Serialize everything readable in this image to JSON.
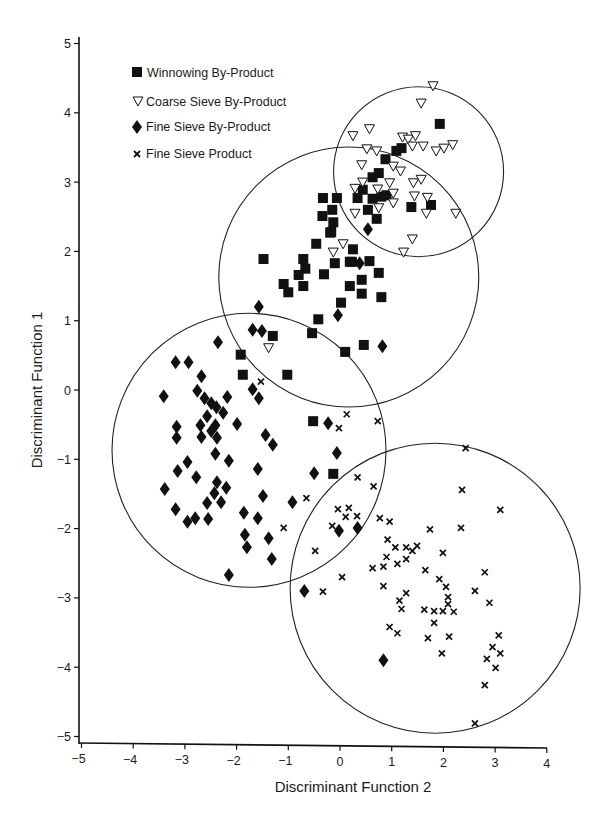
{
  "chart_data": {
    "type": "scatter",
    "title": "",
    "xlabel": "Discriminant Function 2",
    "ylabel": "Discriminant Function 1",
    "xlim": [
      -5,
      4
    ],
    "ylim": [
      -5,
      5
    ],
    "xticks": [
      "-5",
      "-4",
      "-3",
      "-2",
      "-1",
      "0",
      "1",
      "2",
      "3",
      "4"
    ],
    "yticks": [
      "5",
      "4",
      "3",
      "2",
      "1",
      "0",
      "-1",
      "-2",
      "-3",
      "-4",
      "-5"
    ],
    "grid": false,
    "legend_position": "upper-left",
    "legend": [
      {
        "label": "Winnowing By-Product",
        "marker": "filled-square"
      },
      {
        "label": "Coarse Sieve By-Product",
        "marker": "open-triangle-down"
      },
      {
        "label": "Fine Sieve By-Product",
        "marker": "filled-diamond"
      },
      {
        "label": "Fine Sieve Product",
        "marker": "x-cross"
      }
    ],
    "circles": [
      {
        "group": "Coarse Sieve By-Product",
        "cx": 1.52,
        "cy": 3.15,
        "r_px": 85
      },
      {
        "group": "Winnowing By-Product",
        "cx": 0.17,
        "cy": 1.63,
        "r_px": 130
      },
      {
        "group": "Fine Sieve By-Product",
        "cx": -1.76,
        "cy": -0.87,
        "r_px": 137
      },
      {
        "group": "Fine Sieve Product",
        "cx": 1.84,
        "cy": -2.86,
        "r_px": 145
      }
    ],
    "series": [
      {
        "name": "Winnowing By-Product",
        "marker": "filled-square",
        "points": [
          [
            1.93,
            3.84
          ],
          [
            1.19,
            3.49
          ],
          [
            1.09,
            3.45
          ],
          [
            0.88,
            3.33
          ],
          [
            0.75,
            3.13
          ],
          [
            0.63,
            3.07
          ],
          [
            0.44,
            2.89
          ],
          [
            0.34,
            2.77
          ],
          [
            0.63,
            2.76
          ],
          [
            0.8,
            2.79
          ],
          [
            0.9,
            2.81
          ],
          [
            0.54,
            2.6
          ],
          [
            0.71,
            2.47
          ],
          [
            1.38,
            2.64
          ],
          [
            1.76,
            2.67
          ],
          [
            -0.33,
            2.77
          ],
          [
            -0.06,
            2.77
          ],
          [
            -0.15,
            2.6
          ],
          [
            -0.13,
            2.42
          ],
          [
            -0.19,
            2.27
          ],
          [
            0.25,
            2.03
          ],
          [
            -0.1,
            1.83
          ],
          [
            0.19,
            1.85
          ],
          [
            0.57,
            1.86
          ],
          [
            -0.34,
            2.51
          ],
          [
            -0.17,
            2.28
          ],
          [
            -0.46,
            2.11
          ],
          [
            -1.48,
            1.89
          ],
          [
            -0.71,
            1.89
          ],
          [
            -0.67,
            1.75
          ],
          [
            -0.8,
            1.66
          ],
          [
            -0.31,
            1.67
          ],
          [
            0.23,
            1.85
          ],
          [
            0.75,
            1.69
          ],
          [
            0.42,
            1.59
          ],
          [
            0.19,
            1.5
          ],
          [
            0.42,
            1.39
          ],
          [
            0.8,
            1.34
          ],
          [
            -1.09,
            1.53
          ],
          [
            -1.0,
            1.41
          ],
          [
            -0.71,
            1.5
          ],
          [
            0.02,
            1.26
          ],
          [
            -0.42,
            1.02
          ],
          [
            -0.54,
            0.82
          ],
          [
            -1.3,
            0.78
          ],
          [
            0.46,
            0.65
          ],
          [
            0.1,
            0.55
          ],
          [
            -1.92,
            0.51
          ],
          [
            -1.02,
            0.22
          ],
          [
            -1.88,
            0.22
          ],
          [
            -0.52,
            -0.45
          ],
          [
            -0.13,
            -1.21
          ]
        ]
      },
      {
        "name": "Coarse Sieve By-Product",
        "marker": "open-triangle-down",
        "points": [
          [
            1.8,
            4.39
          ],
          [
            1.57,
            4.14
          ],
          [
            0.57,
            3.77
          ],
          [
            0.25,
            3.67
          ],
          [
            1.21,
            3.65
          ],
          [
            1.32,
            3.62
          ],
          [
            1.46,
            3.67
          ],
          [
            1.4,
            3.52
          ],
          [
            1.61,
            3.52
          ],
          [
            1.86,
            3.45
          ],
          [
            2.01,
            3.49
          ],
          [
            2.18,
            3.54
          ],
          [
            0.52,
            3.48
          ],
          [
            0.71,
            3.45
          ],
          [
            0.42,
            3.25
          ],
          [
            1.03,
            3.23
          ],
          [
            1.17,
            3.16
          ],
          [
            1.57,
            3.04
          ],
          [
            0.44,
            3.0
          ],
          [
            0.96,
            2.99
          ],
          [
            1.42,
            2.99
          ],
          [
            0.29,
            2.91
          ],
          [
            0.73,
            2.9
          ],
          [
            1.03,
            2.84
          ],
          [
            1.44,
            2.8
          ],
          [
            1.69,
            2.78
          ],
          [
            1.03,
            2.7
          ],
          [
            0.29,
            2.55
          ],
          [
            0.75,
            2.63
          ],
          [
            1.67,
            2.55
          ],
          [
            2.24,
            2.55
          ],
          [
            1.4,
            2.18
          ],
          [
            1.23,
            1.99
          ],
          [
            0.06,
            2.11
          ],
          [
            -0.13,
            1.99
          ],
          [
            -1.38,
            0.61
          ]
        ]
      },
      {
        "name": "Fine Sieve By-Product",
        "marker": "filled-diamond",
        "points": [
          [
            -1.57,
            1.2
          ],
          [
            -1.69,
            0.87
          ],
          [
            -1.51,
            0.85
          ],
          [
            -0.04,
            1.08
          ],
          [
            0.82,
            0.63
          ],
          [
            0.54,
            2.32
          ],
          [
            0.38,
            1.83
          ],
          [
            -2.36,
            0.69
          ],
          [
            -3.18,
            0.4
          ],
          [
            -2.93,
            0.4
          ],
          [
            -2.68,
            0.2
          ],
          [
            -3.41,
            -0.09
          ],
          [
            -2.76,
            -0.01
          ],
          [
            -2.62,
            -0.12
          ],
          [
            -2.49,
            -0.19
          ],
          [
            -2.39,
            -0.25
          ],
          [
            -2.26,
            -0.33
          ],
          [
            -2.18,
            -0.1
          ],
          [
            -1.69,
            0.01
          ],
          [
            -1.57,
            -0.12
          ],
          [
            -2.57,
            -0.38
          ],
          [
            -2.7,
            -0.51
          ],
          [
            -2.41,
            -0.51
          ],
          [
            -2.49,
            -0.59
          ],
          [
            -1.99,
            -0.49
          ],
          [
            -3.16,
            -0.53
          ],
          [
            -3.16,
            -0.69
          ],
          [
            -2.68,
            -0.68
          ],
          [
            -2.38,
            -0.69
          ],
          [
            -1.44,
            -0.65
          ],
          [
            -1.3,
            -0.79
          ],
          [
            -0.23,
            -0.48
          ],
          [
            -0.06,
            -0.91
          ],
          [
            -2.41,
            -0.92
          ],
          [
            -2.15,
            -1.02
          ],
          [
            -2.95,
            -1.04
          ],
          [
            -3.14,
            -1.17
          ],
          [
            -2.78,
            -1.26
          ],
          [
            -1.59,
            -1.14
          ],
          [
            -0.5,
            -1.2
          ],
          [
            -2.38,
            -1.33
          ],
          [
            -2.2,
            -1.41
          ],
          [
            -2.43,
            -1.49
          ],
          [
            -3.39,
            -1.43
          ],
          [
            -2.3,
            -1.62
          ],
          [
            -2.57,
            -1.63
          ],
          [
            -1.49,
            -1.53
          ],
          [
            -0.92,
            -1.62
          ],
          [
            -3.18,
            -1.72
          ],
          [
            -2.95,
            -1.9
          ],
          [
            -2.8,
            -1.85
          ],
          [
            -2.55,
            -1.86
          ],
          [
            -1.86,
            -1.77
          ],
          [
            -1.59,
            -1.85
          ],
          [
            -1.84,
            -2.09
          ],
          [
            -1.38,
            -2.14
          ],
          [
            -1.8,
            -2.27
          ],
          [
            -1.32,
            -2.44
          ],
          [
            -2.15,
            -2.67
          ],
          [
            -0.69,
            -2.9
          ],
          [
            -0.02,
            -2.03
          ],
          [
            0.34,
            -1.99
          ],
          [
            0.84,
            -3.9
          ]
        ]
      },
      {
        "name": "Fine Sieve Product",
        "marker": "x-cross",
        "points": [
          [
            -1.53,
            0.12
          ],
          [
            0.13,
            -0.35
          ],
          [
            -0.02,
            -0.55
          ],
          [
            0.73,
            -0.45
          ],
          [
            0.34,
            -1.26
          ],
          [
            0.65,
            -1.39
          ],
          [
            -0.65,
            -1.56
          ],
          [
            -1.09,
            -1.99
          ],
          [
            -0.04,
            -1.72
          ],
          [
            0.17,
            -1.7
          ],
          [
            0.11,
            -1.83
          ],
          [
            0.33,
            -1.82
          ],
          [
            -0.15,
            -1.96
          ],
          [
            0.77,
            -1.85
          ],
          [
            0.96,
            -1.9
          ],
          [
            0.92,
            -2.16
          ],
          [
            1.07,
            -2.27
          ],
          [
            -0.48,
            -2.32
          ],
          [
            0.9,
            -2.41
          ],
          [
            0.63,
            -2.57
          ],
          [
            0.84,
            -2.55
          ],
          [
            0.04,
            -2.7
          ],
          [
            0.84,
            -2.83
          ],
          [
            -0.33,
            -2.91
          ],
          [
            2.43,
            -0.84
          ],
          [
            2.36,
            -1.44
          ],
          [
            3.1,
            -1.73
          ],
          [
            1.74,
            -2.01
          ],
          [
            2.34,
            -1.99
          ],
          [
            1.28,
            -2.27
          ],
          [
            1.4,
            -2.32
          ],
          [
            1.49,
            -2.25
          ],
          [
            1.99,
            -2.35
          ],
          [
            1.28,
            -2.44
          ],
          [
            1.11,
            -2.51
          ],
          [
            1.65,
            -2.6
          ],
          [
            2.8,
            -2.63
          ],
          [
            1.92,
            -2.73
          ],
          [
            2.05,
            -2.84
          ],
          [
            2.61,
            -2.9
          ],
          [
            1.28,
            -2.93
          ],
          [
            2.89,
            -3.07
          ],
          [
            1.15,
            -3.04
          ],
          [
            2.09,
            -2.99
          ],
          [
            2.09,
            -3.09
          ],
          [
            1.19,
            -3.16
          ],
          [
            1.63,
            -3.17
          ],
          [
            1.82,
            -3.19
          ],
          [
            1.99,
            -3.19
          ],
          [
            2.2,
            -3.2
          ],
          [
            1.82,
            -3.36
          ],
          [
            0.96,
            -3.42
          ],
          [
            1.11,
            -3.51
          ],
          [
            1.7,
            -3.58
          ],
          [
            2.11,
            -3.56
          ],
          [
            3.07,
            -3.54
          ],
          [
            1.97,
            -3.8
          ],
          [
            2.95,
            -3.71
          ],
          [
            3.1,
            -3.8
          ],
          [
            2.84,
            -3.88
          ],
          [
            3.01,
            -4.01
          ],
          [
            2.8,
            -4.26
          ],
          [
            2.61,
            -4.81
          ]
        ]
      }
    ]
  }
}
